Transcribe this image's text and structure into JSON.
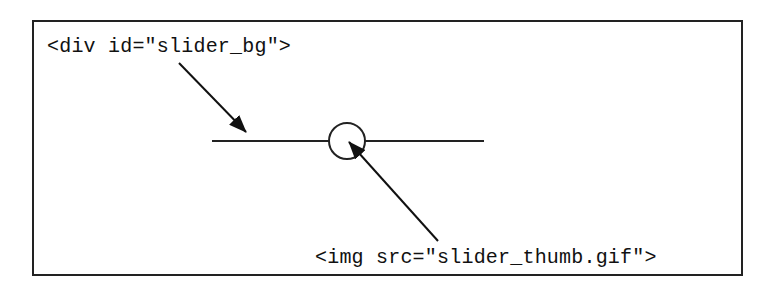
{
  "diagram": {
    "labels": {
      "slider_bg": "<div id=\"slider_bg\">",
      "slider_thumb": "<img src=\"slider_thumb.gif\">"
    },
    "elements": {
      "track": {
        "x1": 212,
        "x2": 484,
        "y": 141
      },
      "thumb": {
        "cx": 347,
        "cy": 141,
        "r": 18
      },
      "arrow_to_track": {
        "from": [
          179,
          63
        ],
        "to": [
          246,
          132
        ]
      },
      "arrow_to_thumb": {
        "from": [
          438,
          241
        ],
        "to": [
          349,
          142
        ]
      }
    },
    "colors": {
      "stroke": "#222222",
      "background": "#ffffff"
    }
  }
}
